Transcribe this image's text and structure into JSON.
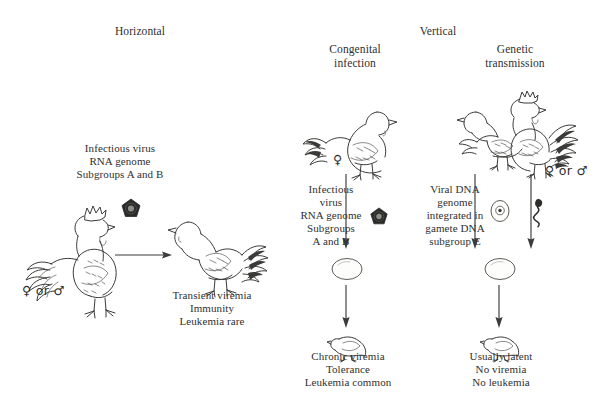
{
  "figure": {
    "type": "diagram"
  },
  "headings": {
    "horizontal": "Horizontal",
    "vertical": "Vertical",
    "congenital": "Congenital\ninfection",
    "genetic": "Genetic\ntransmission"
  },
  "horizontal_branch": {
    "agent_label": "Infectious virus\nRNA genome\nSubgroups A and B",
    "source_sex": "♀ or ♂",
    "outcome_label": "Transient viremia\nImmunity\nLeukemia rare",
    "source_animal": "rooster",
    "recipient_animal": "chicken",
    "particle": "virus-particle"
  },
  "congenital_branch": {
    "agent_label": "Infectious\nvirus\nRNA genome\nSubgroups\nA and B",
    "source_sex": "♀",
    "source_animal": "hen",
    "particle": "virus-particle",
    "intermediate": "egg",
    "offspring": "chick",
    "outcome_label": "Chronic viremia\nTolerance\nLeukemia common"
  },
  "genetic_branch": {
    "agent_label": "Viral DNA\ngenome\nintegrated in\ngamete DNA\nsubgroup E",
    "source_sex": "♀ or ♂",
    "source_animals": "hen-and-rooster-pair",
    "gamete_female": "ovum",
    "gamete_male": "sperm",
    "intermediate": "egg",
    "offspring": "chick",
    "outcome_label": "Usually latent\nNo viremia\nNo leukemia"
  },
  "colors": {
    "ink": "#3a3a38",
    "text": "#30302f",
    "background": "#ffffff",
    "virus": "#2a2a28"
  }
}
